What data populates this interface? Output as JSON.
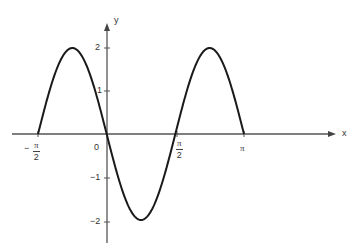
{
  "chart_data": {
    "type": "line",
    "title": "",
    "function": "y = -2 sin(2x)",
    "xlabel": "x",
    "ylabel": "y",
    "xlim": [
      -1.5708,
      3.1416
    ],
    "ylim": [
      -2,
      2
    ],
    "grid": false,
    "legend": null,
    "x_ticks": [
      {
        "value": -1.5708,
        "label": "-π/2"
      },
      {
        "value": 0,
        "label": "0"
      },
      {
        "value": 1.5708,
        "label": "π/2"
      },
      {
        "value": 3.1416,
        "label": "π"
      }
    ],
    "y_ticks": [
      {
        "value": 2,
        "label": "2"
      },
      {
        "value": 1,
        "label": "1"
      },
      {
        "value": -1,
        "label": "-1"
      },
      {
        "value": -2,
        "label": "-2"
      }
    ],
    "series": [
      {
        "name": "y = -2 sin 2x",
        "x": [
          -1.5708,
          -1.1781,
          -0.7854,
          -0.3927,
          0,
          0.3927,
          0.7854,
          1.1781,
          1.5708,
          1.9635,
          2.3562,
          2.7489,
          3.1416
        ],
        "y": [
          0,
          1.414,
          2,
          1.414,
          0,
          -1.414,
          -2,
          -1.414,
          0,
          1.414,
          2,
          1.414,
          0
        ]
      }
    ],
    "key_points": {
      "maxima": [
        {
          "x": -0.7854,
          "y": 2
        },
        {
          "x": 2.3562,
          "y": 2
        }
      ],
      "minima": [
        {
          "x": 0.7854,
          "y": -2
        }
      ],
      "zeros": [
        -1.5708,
        0,
        1.5708,
        3.1416
      ]
    }
  },
  "axes": {
    "x_label": "x",
    "y_label": "y",
    "origin_label": "0",
    "pi_symbol": "π",
    "neg_sign": "−",
    "half_den": "2",
    "y_tick_2": "2",
    "y_tick_1": "1",
    "y_tick_m1": "−1",
    "y_tick_m2": "−2"
  },
  "style": {
    "curve_color": "#1a1a1a",
    "axis_color": "#555555"
  }
}
